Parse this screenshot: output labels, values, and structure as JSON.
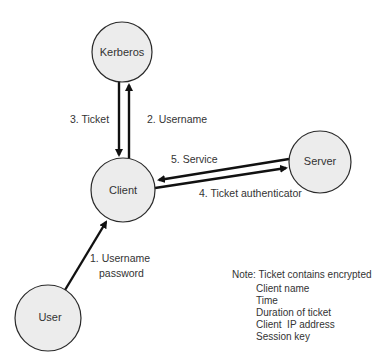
{
  "diagram": {
    "colors": {
      "node_fill": "#ececec",
      "node_stroke": "#2a2a2a",
      "edge": "#111111",
      "text": "#333333",
      "background": "#ffffff"
    },
    "nodes": [
      {
        "id": "kerberos",
        "label": "Kerberos",
        "cx": 122,
        "cy": 52,
        "r": 30
      },
      {
        "id": "client",
        "label": "Client",
        "cx": 123,
        "cy": 190,
        "r": 32
      },
      {
        "id": "server",
        "label": "Server",
        "cx": 320,
        "cy": 162,
        "r": 31
      },
      {
        "id": "user",
        "label": "User",
        "cx": 48,
        "cy": 318,
        "r": 33
      }
    ],
    "edges": [
      {
        "id": "e1",
        "from": "user",
        "to": "client",
        "label_lines": [
          "1. Username",
          "password"
        ]
      },
      {
        "id": "e2",
        "from": "client",
        "to": "kerberos",
        "label": "2. Username"
      },
      {
        "id": "e3",
        "from": "kerberos",
        "to": "client",
        "label": "3. Ticket"
      },
      {
        "id": "e4",
        "from": "client",
        "to": "server",
        "label": "4. Ticket authenticator"
      },
      {
        "id": "e5",
        "from": "server",
        "to": "client",
        "label": "5. Service"
      }
    ],
    "note": {
      "heading": "Note: Ticket contains encrypted",
      "items": [
        "Client name",
        "Time",
        "Duration of ticket",
        "Client  IP address",
        "Session key"
      ]
    }
  }
}
